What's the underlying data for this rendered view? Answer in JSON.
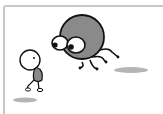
{
  "illustration": {
    "description": "Cartoon of a large round grey creature with big eyes and spindly legs leaping toward a small stick-figure character",
    "colors": {
      "body_fill": "#8a8a8a",
      "outline": "#111111",
      "shadow": "#b5b5b5",
      "frame": "#c8c8c8",
      "background": "#ffffff"
    }
  }
}
